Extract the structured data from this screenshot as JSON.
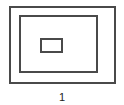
{
  "diagram": {
    "shapes": [
      {
        "name": "outer-rectangle"
      },
      {
        "name": "middle-rectangle"
      },
      {
        "name": "inner-rectangle"
      }
    ],
    "stroke_color": "#4a4a4a",
    "caption": "1"
  }
}
